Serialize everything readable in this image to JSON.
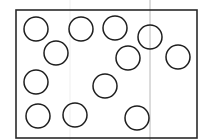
{
  "diagram": {
    "frame": {
      "x": 16,
      "y": 10,
      "width": 181,
      "height": 128,
      "stroke": "#2a2a2a"
    },
    "guide_lines": [
      {
        "x": 150,
        "color": "#b8b8b8"
      },
      {
        "x": 70,
        "color": "#efefef"
      }
    ],
    "circle_radius": 12,
    "circle_stroke": "#1e1e1e",
    "circles": [
      {
        "cx": 36,
        "cy": 29
      },
      {
        "cx": 81,
        "cy": 29
      },
      {
        "cx": 115,
        "cy": 28
      },
      {
        "cx": 150,
        "cy": 37
      },
      {
        "cx": 56,
        "cy": 53
      },
      {
        "cx": 128,
        "cy": 58
      },
      {
        "cx": 178,
        "cy": 57
      },
      {
        "cx": 36,
        "cy": 82
      },
      {
        "cx": 105,
        "cy": 86
      },
      {
        "cx": 38,
        "cy": 116
      },
      {
        "cx": 75,
        "cy": 115
      },
      {
        "cx": 137,
        "cy": 118
      }
    ]
  }
}
